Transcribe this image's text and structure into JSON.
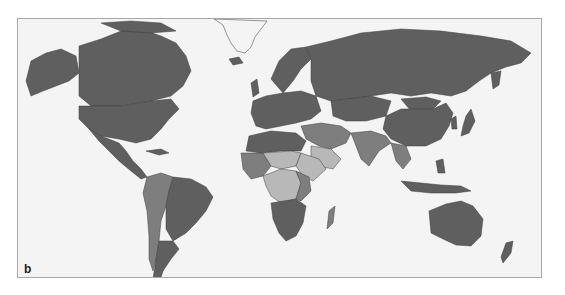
{
  "figure": {
    "panel_label": "b",
    "type": "choropleth world map (Mercator), grayscale, no legend or text shown",
    "colors": {
      "background": "#f4f4f4",
      "frame_border": "#a8a8a8",
      "dark": "#5f5f5f",
      "medium": "#7e7e7e",
      "light": "#b8b8b8",
      "borders": "#3f3f3f"
    },
    "regions": {
      "dark": [
        "North America",
        "Europe",
        "Russia",
        "China",
        "Australia",
        "Brazil",
        "Southern Africa",
        "Greenland outline"
      ],
      "medium": [
        "Middle East",
        "South Asia",
        "Southeast Asia",
        "West Africa",
        "Andean South America"
      ],
      "light": [
        "Sahel region",
        "Central Africa",
        "Arabian peninsula south",
        "Horn of Africa"
      ]
    }
  }
}
